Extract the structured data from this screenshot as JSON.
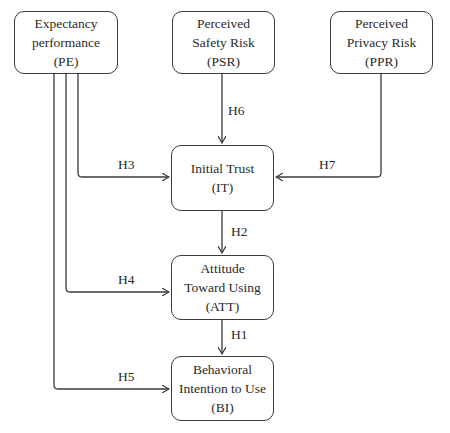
{
  "diagram": {
    "nodes": {
      "pe": {
        "line1": "Expectancy",
        "line2": "performance",
        "abbr": "(PE)"
      },
      "psr": {
        "line1": "Perceived",
        "line2": "Safety Risk",
        "abbr": "(PSR)"
      },
      "ppr": {
        "line1": "Perceived",
        "line2": "Privacy Risk",
        "abbr": "(PPR)"
      },
      "it": {
        "line1": "Initial Trust",
        "abbr": "(IT)"
      },
      "att": {
        "line1": "Attitude",
        "line2": "Toward Using",
        "abbr": "(ATT)"
      },
      "bi": {
        "line1": "Behavioral",
        "line2": "Intention to Use",
        "abbr": "(BI)"
      }
    },
    "edges": [
      {
        "label": "H1",
        "from": "ATT",
        "to": "BI"
      },
      {
        "label": "H2",
        "from": "IT",
        "to": "ATT"
      },
      {
        "label": "H3",
        "from": "PE",
        "to": "IT"
      },
      {
        "label": "H4",
        "from": "PE",
        "to": "ATT"
      },
      {
        "label": "H5",
        "from": "PE",
        "to": "BI"
      },
      {
        "label": "H6",
        "from": "PSR",
        "to": "IT"
      },
      {
        "label": "H7",
        "from": "PPR",
        "to": "IT"
      }
    ],
    "labels": {
      "h1": "H1",
      "h2": "H2",
      "h3": "H3",
      "h4": "H4",
      "h5": "H5",
      "h6": "H6",
      "h7": "H7"
    }
  }
}
